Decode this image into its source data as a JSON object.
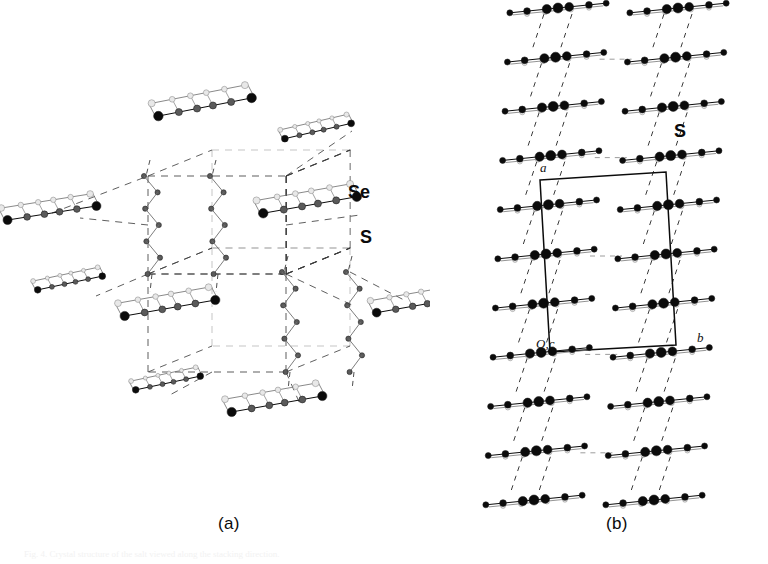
{
  "figure": {
    "type": "crystal-structure-packing-diagram",
    "background_color": "#ffffff",
    "ink_color": "#0b0b0b",
    "mid_atom_color": "#5a5a5a",
    "light_atom_color": "#e8e8e8",
    "dash_color": "#3a3a3a",
    "captions": {
      "panel_a": "(a)",
      "panel_b": "(b)"
    },
    "bottom_text": "Fig. 4. Crystal structure of the salt viewed along the stacking direction.",
    "panel_a": {
      "name": "panel-a",
      "view": "perspective packing view with dashed unit-cell network",
      "labels": {
        "selenium": "Se",
        "sulfur": "S"
      },
      "molecules": [
        {
          "id": "m1",
          "cx": 205,
          "cy": 107,
          "len": 95,
          "tilt": -11,
          "depth": 16
        },
        {
          "id": "m2",
          "cx": 318,
          "cy": 131,
          "len": 68,
          "tilt": -13,
          "depth": 11
        },
        {
          "id": "m3",
          "cx": 52,
          "cy": 213,
          "len": 90,
          "tilt": -9,
          "depth": 15
        },
        {
          "id": "m4",
          "cx": 310,
          "cy": 205,
          "len": 95,
          "tilt": -10,
          "depth": 16
        },
        {
          "id": "m5",
          "cx": 70,
          "cy": 283,
          "len": 66,
          "tilt": -12,
          "depth": 11
        },
        {
          "id": "m6",
          "cx": 170,
          "cy": 308,
          "len": 92,
          "tilt": -10,
          "depth": 16
        },
        {
          "id": "m7",
          "cx": 420,
          "cy": 305,
          "len": 88,
          "tilt": -10,
          "depth": 15
        },
        {
          "id": "m8",
          "cx": 168,
          "cy": 383,
          "len": 66,
          "tilt": -12,
          "depth": 11
        },
        {
          "id": "m9",
          "cx": 277,
          "cy": 404,
          "len": 92,
          "tilt": -10,
          "depth": 16
        }
      ],
      "chains": [
        {
          "id": "c1",
          "x": 148,
          "y_top": 176,
          "y_bot": 274
        },
        {
          "id": "c2",
          "x": 214,
          "y_top": 176,
          "y_bot": 274
        },
        {
          "id": "c3",
          "x": 286,
          "y_top": 272,
          "y_bot": 372
        },
        {
          "id": "c4",
          "x": 350,
          "y_top": 272,
          "y_bot": 372
        }
      ]
    },
    "panel_b": {
      "name": "panel-b",
      "view": "edge-on view of molecular stacks with unit cell",
      "labels": {
        "sulfur": "S",
        "axis_a": "a",
        "axis_b": "b",
        "axis_origin": "O,c"
      },
      "columns": [
        {
          "id": "col-left",
          "x_top": 128,
          "x_bot": 104,
          "n": 11
        },
        {
          "id": "col-right",
          "x_top": 248,
          "x_bot": 224,
          "n": 11
        }
      ],
      "unit_cell": {
        "p1": [
          110,
          180
        ],
        "p2": [
          236,
          172
        ],
        "p3": [
          246,
          345
        ],
        "p4": [
          120,
          352
        ]
      }
    }
  }
}
